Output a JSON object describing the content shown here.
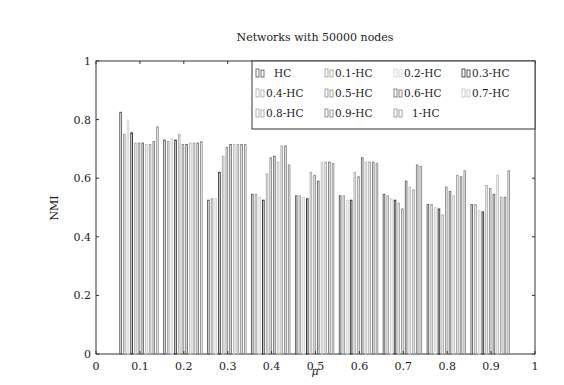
{
  "chart_data": {
    "type": "bar",
    "title": "Networks with 50000 nodes",
    "xlabel": "μ",
    "ylabel": "NMI",
    "xlim": [
      0,
      1
    ],
    "ylim": [
      0,
      1
    ],
    "xticks": [
      "0",
      "0.1",
      "0.2",
      "0.3",
      "0.4",
      "0.5",
      "0.6",
      "0.7",
      "0.8",
      "0.9",
      "1"
    ],
    "yticks": [
      "0",
      "0.2",
      "0.4",
      "0.6",
      "0.8",
      "1"
    ],
    "grid": false,
    "legend_position": "upper right",
    "categories": [
      0.1,
      0.2,
      0.3,
      0.4,
      0.5,
      0.6,
      0.7,
      0.8,
      0.9
    ],
    "series": [
      {
        "name": "HC",
        "color": "#555555",
        "values": [
          0.825,
          0.73,
          0.525,
          0.545,
          0.54,
          0.54,
          0.545,
          0.51,
          0.51
        ]
      },
      {
        "name": "0.1-HC",
        "color": "#9a9a9a",
        "values": [
          0.75,
          0.725,
          0.53,
          0.545,
          0.54,
          0.54,
          0.54,
          0.51,
          0.51
        ]
      },
      {
        "name": "0.2-HC",
        "color": "#cfcfcf",
        "values": [
          0.795,
          0.735,
          0.53,
          0.535,
          0.535,
          0.525,
          0.53,
          0.5,
          0.49
        ]
      },
      {
        "name": "0.3-HC",
        "color": "#2a2a2a",
        "values": [
          0.755,
          0.73,
          0.62,
          0.525,
          0.53,
          0.525,
          0.525,
          0.495,
          0.485
        ]
      },
      {
        "name": "0.4-HC",
        "color": "#a8a8a8",
        "values": [
          0.72,
          0.75,
          0.675,
          0.615,
          0.62,
          0.62,
          0.515,
          0.475,
          0.575
        ]
      },
      {
        "name": "0.5-HC",
        "color": "#8a8a8a",
        "values": [
          0.72,
          0.715,
          0.705,
          0.67,
          0.61,
          0.605,
          0.495,
          0.57,
          0.565
        ]
      },
      {
        "name": "0.6-HC",
        "color": "#666666",
        "values": [
          0.72,
          0.715,
          0.715,
          0.675,
          0.59,
          0.67,
          0.59,
          0.555,
          0.545
        ]
      },
      {
        "name": "0.7-HC",
        "color": "#bdbdbd",
        "values": [
          0.715,
          0.72,
          0.715,
          0.655,
          0.655,
          0.655,
          0.57,
          0.54,
          0.61
        ]
      },
      {
        "name": "0.8-HC",
        "color": "#9e9e9e",
        "values": [
          0.715,
          0.72,
          0.715,
          0.71,
          0.655,
          0.655,
          0.56,
          0.61,
          0.535
        ]
      },
      {
        "name": "0.9-HC",
        "color": "#7a7a7a",
        "values": [
          0.725,
          0.72,
          0.715,
          0.71,
          0.655,
          0.655,
          0.645,
          0.605,
          0.535
        ]
      },
      {
        "name": "1-HC",
        "color": "#8c8c8c",
        "values": [
          0.775,
          0.725,
          0.715,
          0.645,
          0.65,
          0.65,
          0.64,
          0.625,
          0.625
        ]
      }
    ]
  }
}
